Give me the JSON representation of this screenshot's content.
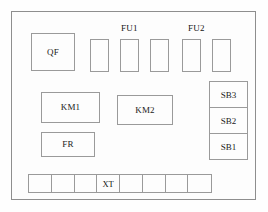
{
  "diagram": {
    "background_color": "#fdfdfd",
    "line_color": "#9a9a9a",
    "text_color": "#1a1a1a"
  },
  "frame": {
    "name": "cabinet-outline"
  },
  "components": {
    "qf": {
      "label": "QF",
      "x": 31,
      "y": 33,
      "w": 44,
      "h": 38
    },
    "km1": {
      "label": "KM1",
      "x": 41,
      "y": 92,
      "w": 59,
      "h": 31
    },
    "km2": {
      "label": "KM2",
      "x": 117,
      "y": 95,
      "w": 56,
      "h": 30
    },
    "fr": {
      "label": "FR",
      "x": 41,
      "y": 132,
      "w": 54,
      "h": 25
    }
  },
  "fuses": {
    "group_labels": [
      {
        "text": "FU1",
        "x": 121,
        "y": 23
      },
      {
        "text": "FU2",
        "x": 188,
        "y": 23
      }
    ],
    "blocks": [
      {
        "x": 90,
        "y": 39,
        "w": 19,
        "h": 33
      },
      {
        "x": 120,
        "y": 39,
        "w": 19,
        "h": 33
      },
      {
        "x": 150,
        "y": 39,
        "w": 19,
        "h": 33
      },
      {
        "x": 182,
        "y": 39,
        "w": 19,
        "h": 33
      },
      {
        "x": 212,
        "y": 39,
        "w": 19,
        "h": 33
      }
    ]
  },
  "button_stack": {
    "x": 209,
    "y": 81,
    "w": 39,
    "h": 79,
    "cells": [
      {
        "label": "SB3"
      },
      {
        "label": "SB2"
      },
      {
        "label": "SB1"
      }
    ]
  },
  "terminal_strip": {
    "x": 28,
    "y": 174,
    "w": 184,
    "h": 19,
    "cells": [
      {
        "label": ""
      },
      {
        "label": ""
      },
      {
        "label": ""
      },
      {
        "label": "XT"
      },
      {
        "label": ""
      },
      {
        "label": ""
      },
      {
        "label": ""
      },
      {
        "label": ""
      }
    ]
  }
}
